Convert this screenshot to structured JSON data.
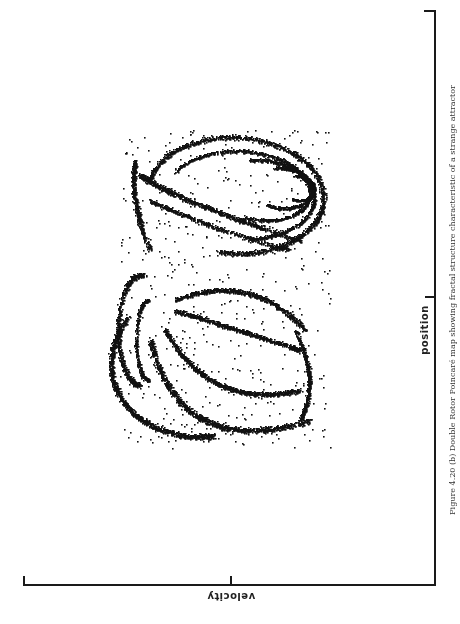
{
  "figure": {
    "caption": "Figure 4.20 (b) Double Rotor Poincaré map showing fractal structure characteristic of a strange attractor",
    "orientation": "rotated 90° (scanned page)"
  },
  "chart_data": {
    "type": "scatter",
    "title": "",
    "xlabel": "velocity",
    "ylabel": "position",
    "x_ticks": [
      "0"
    ],
    "y_ticks": [
      "0"
    ],
    "grid": false,
    "legend": null,
    "point_color": "#111111",
    "series": [
      {
        "name": "upper lobe",
        "shape": "nested elliptical arcs",
        "approx_center_px": [
          230,
          200
        ]
      },
      {
        "name": "lower lobe",
        "shape": "hooked crescent bands",
        "approx_center_px": [
          220,
          370
        ]
      }
    ]
  },
  "axes": {
    "velocity_label": "velocity",
    "position_label": "position"
  }
}
